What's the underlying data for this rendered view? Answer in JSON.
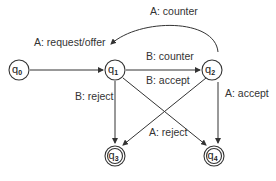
{
  "diagram": {
    "type": "state-machine",
    "nodes": [
      {
        "id": "q0",
        "label": "q",
        "sub": "0",
        "accepting": false
      },
      {
        "id": "q1",
        "label": "q",
        "sub": "1",
        "accepting": false
      },
      {
        "id": "q2",
        "label": "q",
        "sub": "2",
        "accepting": false
      },
      {
        "id": "q3",
        "label": "q",
        "sub": "3",
        "accepting": true
      },
      {
        "id": "q4",
        "label": "q",
        "sub": "4",
        "accepting": true
      }
    ],
    "edges": [
      {
        "from": "q0",
        "to": "q1",
        "label": "A: request/offer"
      },
      {
        "from": "q1",
        "to": "q2",
        "label": "B: counter"
      },
      {
        "from": "q2",
        "to": "q1",
        "label": "A: counter"
      },
      {
        "from": "q1",
        "to": "q3",
        "label": "B: reject"
      },
      {
        "from": "q2",
        "to": "q3",
        "label": "B: accept"
      },
      {
        "from": "q1",
        "to": "q4",
        "label": "A: reject"
      },
      {
        "from": "q2",
        "to": "q4",
        "label": "A: accept"
      }
    ]
  }
}
